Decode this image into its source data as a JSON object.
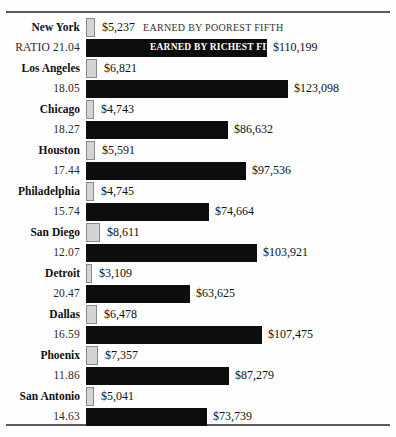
{
  "chart_data": {
    "type": "bar",
    "title": "",
    "xlabel": "",
    "ylabel": "",
    "orientation": "horizontal",
    "grid": false,
    "legend_position": "inline-first-row",
    "series": [
      {
        "name": "EARNED BY POOREST FIFTH",
        "key": "poorest",
        "color": "#d4d4d4"
      },
      {
        "name": "EARNED BY RICHEST FIFTH",
        "key": "richest",
        "color": "#0d0d0d"
      }
    ],
    "categories": [
      "New York",
      "Los Angeles",
      "Chicago",
      "Houston",
      "Philadelphia",
      "San Diego",
      "Detroit",
      "Dallas",
      "Phoenix",
      "San Antonio"
    ],
    "xlim": [
      0,
      125000
    ],
    "rows": [
      {
        "city": "New York",
        "ratio_label": "RATIO 21.04",
        "ratio": 21.04,
        "poorest": 5237,
        "poorest_label": "$5,237",
        "richest": 110199,
        "richest_label": "$110,199",
        "poorest_note": "EARNED BY POOREST FIFTH",
        "richest_note": "EARNED BY RICHEST FIFTH"
      },
      {
        "city": "Los Angeles",
        "ratio_label": "18.05",
        "ratio": 18.05,
        "poorest": 6821,
        "poorest_label": "$6,821",
        "richest": 123098,
        "richest_label": "$123,098"
      },
      {
        "city": "Chicago",
        "ratio_label": "18.27",
        "ratio": 18.27,
        "poorest": 4743,
        "poorest_label": "$4,743",
        "richest": 86632,
        "richest_label": "$86,632"
      },
      {
        "city": "Houston",
        "ratio_label": "17.44",
        "ratio": 17.44,
        "poorest": 5591,
        "poorest_label": "$5,591",
        "richest": 97536,
        "richest_label": "$97,536"
      },
      {
        "city": "Philadelphia",
        "ratio_label": "15.74",
        "ratio": 15.74,
        "poorest": 4745,
        "poorest_label": "$4,745",
        "richest": 74664,
        "richest_label": "$74,664"
      },
      {
        "city": "San Diego",
        "ratio_label": "12.07",
        "ratio": 12.07,
        "poorest": 8611,
        "poorest_label": "$8,611",
        "richest": 103921,
        "richest_label": "$103,921"
      },
      {
        "city": "Detroit",
        "ratio_label": "20.47",
        "ratio": 20.47,
        "poorest": 3109,
        "poorest_label": "$3,109",
        "richest": 63625,
        "richest_label": "$63,625"
      },
      {
        "city": "Dallas",
        "ratio_label": "16.59",
        "ratio": 16.59,
        "poorest": 6478,
        "poorest_label": "$6,478",
        "richest": 107475,
        "richest_label": "$107,475"
      },
      {
        "city": "Phoenix",
        "ratio_label": "11.86",
        "ratio": 11.86,
        "poorest": 7357,
        "poorest_label": "$7,357",
        "richest": 87279,
        "richest_label": "$87,279"
      },
      {
        "city": "San Antonio",
        "ratio_label": "14.63",
        "ratio": 14.63,
        "poorest": 5041,
        "poorest_label": "$5,041",
        "richest": 73739,
        "richest_label": "$73,739"
      }
    ]
  },
  "style": {
    "bar_origin_px": 86,
    "px_per_dollar": 0.001641,
    "poor_min_px": 6,
    "rich_color": "#0d0d0d",
    "poor_color": "#d4d4d4",
    "rule_color": "#5a5a5a"
  }
}
